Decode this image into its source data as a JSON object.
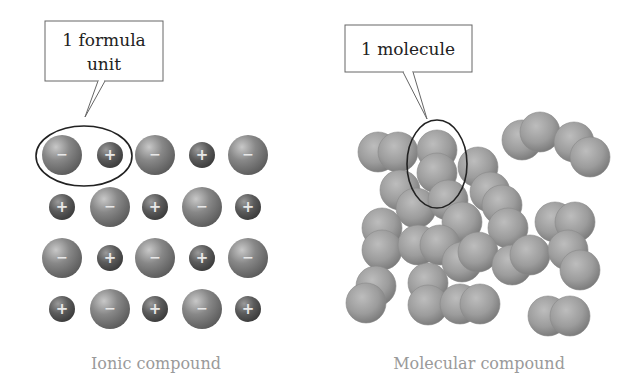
{
  "ionic": {
    "callout": {
      "line1": "1 formula",
      "line2": "unit"
    },
    "caption": "Ionic compound",
    "anion_sign": "−",
    "cation_sign": "+",
    "grid": [
      [
        "anion",
        "cation",
        "anion",
        "cation",
        "anion"
      ],
      [
        "cation",
        "anion",
        "cation",
        "anion",
        "cation"
      ],
      [
        "anion",
        "cation",
        "anion",
        "cation",
        "anion"
      ],
      [
        "cation",
        "anion",
        "cation",
        "anion",
        "cation"
      ]
    ]
  },
  "molecular": {
    "callout": {
      "line1": "1 molecule"
    },
    "caption": "Molecular compound"
  },
  "colors": {
    "anion": "#7a7a7a",
    "cation": "#555555",
    "molecule": "#9a9a9a",
    "outline": "#222222",
    "caption": "#9a9a9a"
  }
}
